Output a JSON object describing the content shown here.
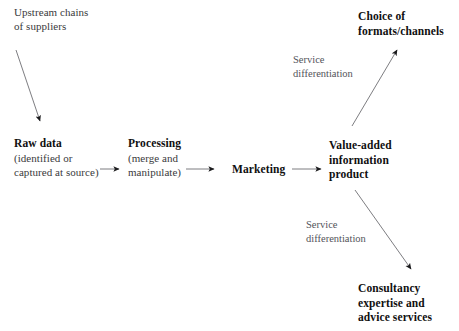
{
  "diagram": {
    "background_color": "#ffffff",
    "line_color": "#6e6e73",
    "heading_color": "#100f10",
    "sub_color": "#3a3a3c",
    "annotation_color": "#53535a",
    "nodes": {
      "upstream": {
        "line1": "Upstream chains",
        "line2": "of suppliers"
      },
      "raw_data": {
        "heading": "Raw data",
        "sub_line1": "(identified or",
        "sub_line2": "captured at source)"
      },
      "processing": {
        "heading": "Processing",
        "sub_line1": "(merge and",
        "sub_line2": "manipulate)"
      },
      "marketing": {
        "heading": "Marketing"
      },
      "value_added": {
        "heading_line1": "Value-added",
        "heading_line2": "information",
        "heading_line3": "product"
      },
      "choice": {
        "heading_line1": "Choice of",
        "heading_line2": "formats/channels"
      },
      "consultancy": {
        "heading_line1": "Consultancy",
        "heading_line2": "expertise and",
        "heading_line3": "advice services"
      }
    },
    "annotations": {
      "service_diff_top": {
        "line1": "Service",
        "line2": "differentiation"
      },
      "service_diff_bottom": {
        "line1": "Service",
        "line2": "differentiation"
      }
    },
    "arrows": [
      {
        "name": "upstream-to-raw-data",
        "x1": 16,
        "y1": 50,
        "x2": 40,
        "y2": 121
      },
      {
        "name": "raw-data-to-processing",
        "x1": 100,
        "y1": 169,
        "x2": 119,
        "y2": 169
      },
      {
        "name": "processing-to-marketing",
        "x1": 186,
        "y1": 169,
        "x2": 214,
        "y2": 169
      },
      {
        "name": "marketing-to-value-added",
        "x1": 292,
        "y1": 169,
        "x2": 321,
        "y2": 169
      },
      {
        "name": "value-added-to-choice",
        "x1": 352,
        "y1": 126,
        "x2": 397,
        "y2": 50
      },
      {
        "name": "value-added-to-consultancy",
        "x1": 355,
        "y1": 190,
        "x2": 411,
        "y2": 269
      }
    ]
  }
}
